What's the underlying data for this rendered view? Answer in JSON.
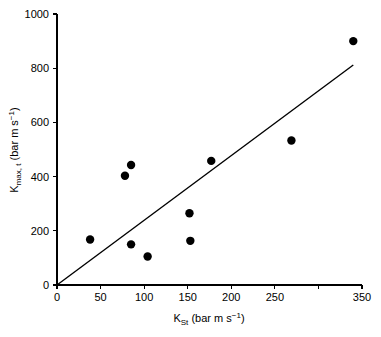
{
  "chart_data": {
    "type": "scatter",
    "title": "",
    "xlabel": "K_St (bar m s^-1)",
    "ylabel": "K_max, t (bar m s^-1)",
    "xlabel_parts": {
      "base": "K",
      "subscript": "St",
      "units": " (bar m s",
      "exponent": "−1",
      "units_close": ")"
    },
    "ylabel_parts": {
      "base": "K",
      "subscript": "max, t",
      "units": " (bar m s",
      "exponent": "−1",
      "units_close": ")"
    },
    "xlim": [
      0,
      350
    ],
    "ylim": [
      0,
      1000
    ],
    "xticks": [
      0,
      50,
      100,
      150,
      200,
      250,
      300,
      350
    ],
    "xtick_labels": [
      "0",
      "50",
      "100",
      "150",
      "200",
      "250",
      "",
      "350"
    ],
    "yticks": [
      0,
      200,
      400,
      600,
      800,
      1000
    ],
    "ytick_labels": [
      "0",
      "200",
      "400",
      "600",
      "800",
      "1000"
    ],
    "grid": false,
    "legend": null,
    "marker_color": "#000000",
    "line_color": "#000000",
    "points": [
      {
        "x": 38,
        "y": 168
      },
      {
        "x": 78,
        "y": 403
      },
      {
        "x": 85,
        "y": 443
      },
      {
        "x": 85,
        "y": 150
      },
      {
        "x": 104,
        "y": 105
      },
      {
        "x": 152,
        "y": 265
      },
      {
        "x": 153,
        "y": 163
      },
      {
        "x": 177,
        "y": 458
      },
      {
        "x": 269,
        "y": 533
      },
      {
        "x": 340,
        "y": 900
      }
    ],
    "trend_line": {
      "x_start": 0,
      "y_start": 0,
      "x_end": 340,
      "y_end": 812
    }
  }
}
